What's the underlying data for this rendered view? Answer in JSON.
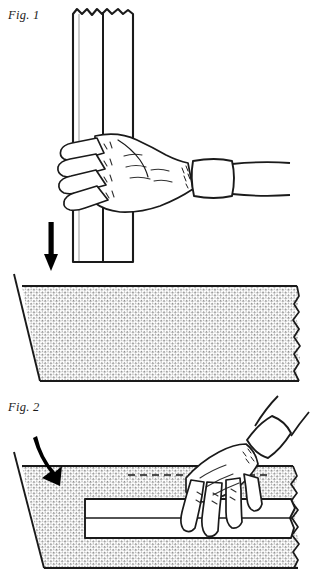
{
  "document": {
    "type": "patent-line-drawing",
    "width": 312,
    "height": 584,
    "background_color": "#ffffff",
    "ink_color": "#1a1a1a"
  },
  "figures": [
    {
      "id": "fig1",
      "label": "Fig. 1",
      "label_position": {
        "x": 8,
        "y": 8
      },
      "description": "A hand grasping two vertical boards from the side, with a downward arrow indicating motion, above a stippled trapezoidal surface with a torn right edge.",
      "elements": {
        "boards_orientation": "vertical",
        "board_count": 2,
        "board_top_edge": "jagged-break",
        "board_bottom_edge": "flat",
        "arrow_direction": "down",
        "arrow_style": "straight-solid",
        "hand_side": "right",
        "hand_pose": "grip",
        "finger_count": 4,
        "cuff": "wristband",
        "surface_shape": "trapezoid",
        "surface_fill": "stipple",
        "surface_right_edge": "torn"
      }
    },
    {
      "id": "fig2",
      "label": "Fig. 2",
      "label_position": {
        "x": 8,
        "y": 400
      },
      "description": "A hand pressing two horizontal boards down onto the stippled trapezoidal surface, with a curved arrow indicating downward placement motion.",
      "elements": {
        "boards_orientation": "horizontal",
        "board_count": 2,
        "board_right_edge": "torn",
        "arrow_direction": "down-right",
        "arrow_style": "curved-tapered",
        "hand_side": "right",
        "hand_pose": "press",
        "finger_count": 4,
        "cuff": "wristband",
        "guide_line": "dashed",
        "surface_shape": "trapezoid",
        "surface_fill": "stipple",
        "surface_right_edge": "torn"
      }
    }
  ],
  "colors": {
    "ink": "#1a1a1a",
    "paper": "#ffffff",
    "stipple": "#7a7a7a",
    "arrow": "#000000"
  }
}
